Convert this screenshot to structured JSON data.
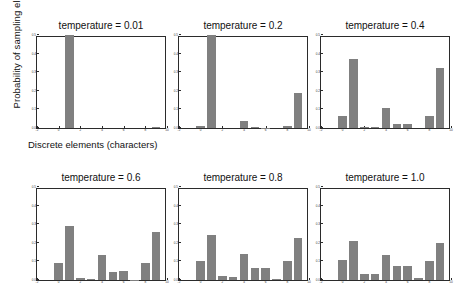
{
  "figure": {
    "ylabel": "Probability of sampling element",
    "xlabel": "Discrete elements (characters)",
    "bar_color": "#808080",
    "axis_color": "#2b2b2b",
    "background": "#ffffff"
  },
  "chart_data": {
    "type": "bar",
    "title": "",
    "xlabel": "Discrete elements (characters)",
    "ylabel": "Probability of sampling element",
    "ylim": [
      0.0,
      0.5
    ],
    "xlim": [
      -2,
      10
    ],
    "grid": false,
    "legend": null,
    "ytick_labels": [
      "0.0",
      "0.1",
      "0.2",
      "0.3",
      "0.4",
      "0.5"
    ],
    "ytick_values": [
      0.0,
      0.1,
      0.2,
      0.3,
      0.4,
      0.5
    ],
    "xtick_labels": [
      "-2",
      "0",
      "2",
      "4",
      "6",
      "8",
      "10"
    ],
    "xtick_values": [
      -2,
      0,
      2,
      4,
      6,
      8,
      10
    ],
    "categories": [
      0,
      1,
      2,
      3,
      4,
      5,
      6,
      7,
      8,
      9
    ],
    "panels": [
      {
        "title": "temperature = 0.01",
        "temperature": 0.01,
        "values": [
          0.0,
          0.5,
          0.0,
          0.0,
          0.0,
          0.0,
          0.0,
          0.0,
          0.0,
          0.004
        ]
      },
      {
        "title": "temperature = 0.2",
        "temperature": 0.2,
        "values": [
          0.012,
          0.5,
          0.0,
          0.0,
          0.036,
          0.003,
          0.002,
          0.0,
          0.011,
          0.186
        ]
      },
      {
        "title": "temperature = 0.4",
        "temperature": 0.4,
        "values": [
          0.067,
          0.37,
          0.004,
          0.003,
          0.108,
          0.022,
          0.023,
          0.0,
          0.063,
          0.32
        ]
      },
      {
        "title": "temperature = 0.6",
        "temperature": 0.6,
        "values": [
          0.093,
          0.29,
          0.012,
          0.008,
          0.135,
          0.043,
          0.047,
          0.002,
          0.092,
          0.26
        ]
      },
      {
        "title": "temperature = 0.8",
        "temperature": 0.8,
        "values": [
          0.101,
          0.24,
          0.022,
          0.018,
          0.14,
          0.062,
          0.065,
          0.005,
          0.1,
          0.225
        ]
      },
      {
        "title": "temperature = 1.0",
        "temperature": 1.0,
        "values": [
          0.105,
          0.21,
          0.035,
          0.03,
          0.135,
          0.073,
          0.078,
          0.012,
          0.104,
          0.2
        ]
      }
    ]
  }
}
